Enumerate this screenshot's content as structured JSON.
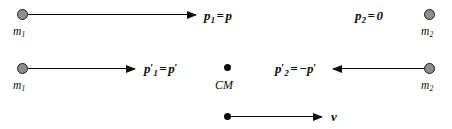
{
  "diagram": {
    "width": 452,
    "height": 129,
    "background_color": "#ffffff",
    "stroke_color": "#0d0d0d",
    "mass_fill_color": "#8e8e8e",
    "rows": [
      {
        "id": "lab-frame-before",
        "left_mass_label": "m",
        "left_mass_subscript": "1",
        "left_momentum_symbol": "p",
        "left_momentum_subscript": "1",
        "left_momentum_equals": "=",
        "left_momentum_value": "p",
        "right_momentum_symbol": "p",
        "right_momentum_subscript": "2",
        "right_momentum_equals": "=",
        "right_momentum_value": "0",
        "right_mass_label": "m",
        "right_mass_subscript": "2"
      },
      {
        "id": "cm-frame",
        "left_mass_label": "m",
        "left_mass_subscript": "1",
        "left_momentum_symbol": "p",
        "left_momentum_prime": "′",
        "left_momentum_subscript": "1",
        "left_momentum_equals": "=",
        "left_momentum_value": "p",
        "left_momentum_value_prime": "′",
        "center_label": "CM",
        "right_momentum_symbol": "p",
        "right_momentum_prime": "′",
        "right_momentum_subscript": "2",
        "right_momentum_equals": "=",
        "right_momentum_sign": "−",
        "right_momentum_value": "p",
        "right_momentum_value_prime": "′",
        "right_mass_label": "m",
        "right_mass_subscript": "2"
      },
      {
        "id": "cm-velocity",
        "velocity_label": "v"
      }
    ]
  }
}
